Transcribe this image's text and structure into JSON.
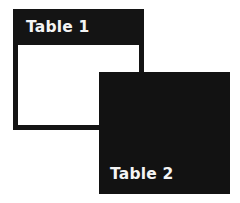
{
  "diagram": {
    "tables": [
      {
        "label": "Table 1",
        "header_color": "#141414",
        "body_color": "#ffffff",
        "border_color": "#141414",
        "text_color": "#f4f4f4"
      },
      {
        "label": "Table 2",
        "fill_color": "#121212",
        "text_color": "#f4f4f4"
      }
    ],
    "relationship": "Table 2 overlaps the lower-right corner of Table 1"
  }
}
